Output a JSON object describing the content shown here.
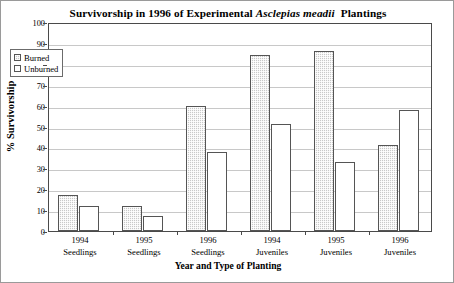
{
  "chart_data": {
    "type": "bar",
    "title_parts": {
      "before": "Survivorship in 1996 of Experimental ",
      "italic": "Asclepias meadii",
      "after": "Plantings"
    },
    "xlabel": "Year and Type of Planting",
    "ylabel": "% Survivorship",
    "ylim": [
      0,
      100
    ],
    "ytick_step": 10,
    "yticks": [
      "0",
      "10",
      "20",
      "30",
      "40",
      "50",
      "60",
      "70",
      "80",
      "90",
      "100"
    ],
    "grid": true,
    "legend_position": "upper-left-inside",
    "categories": [
      {
        "line1": "1994",
        "line2": "Seedlings"
      },
      {
        "line1": "1995",
        "line2": "Seedlings"
      },
      {
        "line1": "1996",
        "line2": "Seedlings"
      },
      {
        "line1": "1994",
        "line2": "Juveniles"
      },
      {
        "line1": "1995",
        "line2": "Juveniles"
      },
      {
        "line1": "1996",
        "line2": "Juveniles"
      }
    ],
    "series": [
      {
        "name": "Burned",
        "fill": "hatched-gray",
        "color": "#c9c9c9",
        "values": [
          17,
          12,
          60,
          84,
          86,
          41
        ]
      },
      {
        "name": "Unburned",
        "fill": "white",
        "color": "#ffffff",
        "values": [
          12,
          7,
          38,
          51,
          33,
          58
        ]
      }
    ]
  },
  "legend": {
    "items": [
      {
        "label": "Burned"
      },
      {
        "label": "Unburned"
      }
    ]
  }
}
